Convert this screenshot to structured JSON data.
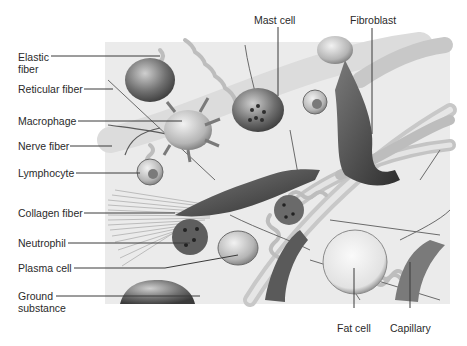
{
  "diagram": {
    "colors": {
      "background": "#ffffff",
      "tissue_bg": "#ebebeb",
      "cell_dark": "#5a5a5a",
      "fiber": "#b8b8b8",
      "label_text": "#2a2a2a",
      "leader_line": "#3a3a3a"
    },
    "labels_left": [
      {
        "id": "elastic-fiber",
        "text": "Elastic fiber",
        "line1": "Elastic",
        "line2": "fiber"
      },
      {
        "id": "reticular-fiber",
        "text": "Reticular fiber"
      },
      {
        "id": "macrophage",
        "text": "Macrophage"
      },
      {
        "id": "nerve-fiber",
        "text": "Nerve fiber"
      },
      {
        "id": "lymphocyte",
        "text": "Lymphocyte"
      },
      {
        "id": "collagen-fiber",
        "text": "Collagen fiber"
      },
      {
        "id": "neutrophil",
        "text": "Neutrophil"
      },
      {
        "id": "plasma-cell",
        "text": "Plasma cell"
      },
      {
        "id": "ground-substance",
        "text": "Ground substance",
        "line1": "Ground",
        "line2": "substance"
      }
    ],
    "labels_top": [
      {
        "id": "mast-cell",
        "text": "Mast cell"
      },
      {
        "id": "fibroblast",
        "text": "Fibroblast"
      }
    ],
    "labels_bottom": [
      {
        "id": "fat-cell",
        "text": "Fat cell"
      },
      {
        "id": "capillary",
        "text": "Capillary"
      }
    ]
  }
}
